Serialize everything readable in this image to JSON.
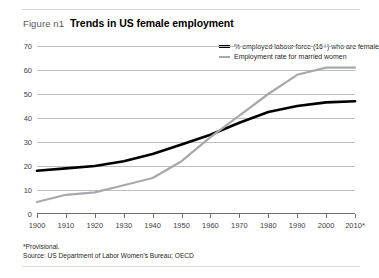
{
  "figure": {
    "number": "Figure n1",
    "title": "Trends in US female employment"
  },
  "footnotes": {
    "provisional": "*Provisional.",
    "source": "Source: US Department of Labor Women's Bureau; OECD"
  },
  "legend": {
    "position": "top-right",
    "items": [
      {
        "label": "% employed labour force (16+) who are female",
        "color": "#000000",
        "swatch": "thick-line-swatch"
      },
      {
        "label": "Employment rate for married women",
        "color": "#a7a9ac",
        "swatch": "thin-line-swatch"
      }
    ]
  },
  "chart_data": {
    "type": "line",
    "title": "Trends in US female employment",
    "xlabel": "",
    "ylabel": "",
    "x": [
      1900,
      1910,
      1920,
      1930,
      1940,
      1950,
      1960,
      1970,
      1980,
      1990,
      2000,
      2010
    ],
    "xticklabels": [
      "1900",
      "1910",
      "1920",
      "1930",
      "1940",
      "1950",
      "1960",
      "1970",
      "1980",
      "1990",
      "2000",
      "2010*"
    ],
    "xlim": [
      1900,
      2010
    ],
    "ylim": [
      0,
      70
    ],
    "yticks": [
      0,
      10,
      20,
      30,
      40,
      50,
      60,
      70
    ],
    "yticklabels": [
      "0",
      "10",
      "20",
      "30",
      "40",
      "50",
      "60",
      "70"
    ],
    "grid": "horizontal",
    "series": [
      {
        "name": "% employed labour force (16+) who are female",
        "color": "#000000",
        "values": [
          18,
          19,
          20,
          22,
          25,
          29,
          33,
          38,
          42.5,
          45,
          46.5,
          47
        ]
      },
      {
        "name": "Employment rate for married women",
        "color": "#a7a9ac",
        "values": [
          5,
          8,
          9,
          12,
          15,
          22,
          32,
          41,
          50,
          58,
          61,
          61
        ]
      }
    ]
  },
  "colors": {
    "series_black": "#000000",
    "series_gray": "#a7a9ac",
    "gridline": "#bcbec0",
    "axis": "#6d6e71",
    "rule": "#d9d9d9",
    "text": "#231f20",
    "muted_text": "#58595b"
  }
}
